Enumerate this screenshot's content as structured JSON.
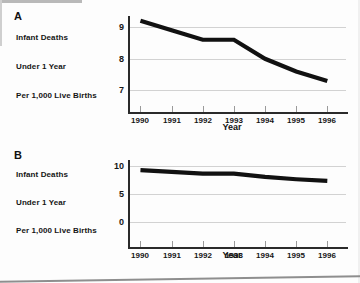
{
  "figure": {
    "background_color": "#fdfdfd",
    "line_color": "#111111",
    "grid_color": "#d2d2d2"
  },
  "panels": [
    {
      "letter": "A",
      "caption_lines": [
        "Infant Deaths",
        "Under 1 Year",
        "Per  1,000 Live Births"
      ],
      "chart_data": {
        "type": "line",
        "title": "",
        "xlabel": "Year",
        "ylabel": "Infant Deaths Under 1 Year Per 1,000 Live Births",
        "x": [
          1990,
          1991,
          1992,
          1993,
          1994,
          1995,
          1996
        ],
        "categories": [
          "1990",
          "1991",
          "1992",
          "1993",
          "1994",
          "1995",
          "1996"
        ],
        "values": [
          9.2,
          8.9,
          8.6,
          8.6,
          8.0,
          7.6,
          7.3
        ],
        "series": [
          {
            "name": "Infant mortality rate",
            "values": [
              9.2,
              8.9,
              8.6,
              8.6,
              8.0,
              7.6,
              7.3
            ]
          }
        ],
        "ylim": [
          6.7,
          9.35
        ],
        "yticks": [
          7,
          8,
          9
        ],
        "ytick_labels": [
          "7",
          "8",
          "9"
        ],
        "xlim": [
          1989.6,
          1996.6
        ],
        "grid": true,
        "legend": "none"
      }
    },
    {
      "letter": "B",
      "caption_lines": [
        "Infant Deaths",
        "Under 1 Year",
        "Per  1,000 Live Births"
      ],
      "chart_data": {
        "type": "line",
        "title": "",
        "xlabel": "Year",
        "ylabel": "Infant Deaths Under 1 Year Per 1,000 Live Births",
        "x": [
          1990,
          1991,
          1992,
          1993,
          1994,
          1995,
          1996
        ],
        "categories": [
          "1990",
          "1991",
          "1992",
          "1993",
          "1994",
          "1995",
          "1996"
        ],
        "values": [
          9.2,
          8.9,
          8.6,
          8.6,
          8.0,
          7.6,
          7.3
        ],
        "series": [
          {
            "name": "Infant mortality rate",
            "values": [
              9.2,
              8.9,
              8.6,
              8.6,
              8.0,
              7.6,
              7.3
            ]
          }
        ],
        "ylim": [
          -0.5,
          11.0
        ],
        "yticks": [
          0,
          5,
          10
        ],
        "ytick_labels": [
          "0",
          "5",
          "10"
        ],
        "xlim": [
          1989.6,
          1996.6
        ],
        "grid": true,
        "legend": "none"
      }
    }
  ]
}
